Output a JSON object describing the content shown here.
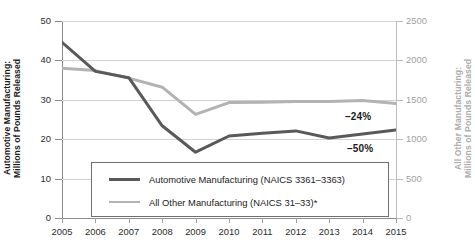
{
  "chart_data": {
    "type": "line",
    "title": "",
    "xlabel": "",
    "categories": [
      "2005",
      "2006",
      "2007",
      "2008",
      "2009",
      "2010",
      "2011",
      "2012",
      "2013",
      "2014",
      "2015"
    ],
    "x": [
      2005,
      2006,
      2007,
      2008,
      2009,
      2010,
      2011,
      2012,
      2013,
      2014,
      2015
    ],
    "grid": true,
    "legend_position": "inside-bottom-center",
    "axes": {
      "left": {
        "label_line1": "Automotive Manufacturing:",
        "label_line2": "Millions of Pounds Released",
        "ticks": [
          0,
          10,
          20,
          30,
          40,
          50
        ],
        "tick_labels": [
          "0",
          "10",
          "20",
          "30",
          "40",
          "50"
        ],
        "ylim": [
          0,
          50
        ],
        "color": "#1b1b1b"
      },
      "right": {
        "label_line1": "All Other Manufacturing:",
        "label_line2": "Millions of Pounds Released",
        "ticks": [
          0,
          500,
          1000,
          1500,
          2000,
          2500
        ],
        "tick_labels": [
          "0",
          "500",
          "1000",
          "1500",
          "2000",
          "2500"
        ],
        "ylim": [
          0,
          2500
        ],
        "color": "#adadad"
      }
    },
    "series": [
      {
        "name": "Automotive Manufacturing (NAICS 3361–3363)",
        "axis": "left",
        "color": "#595959",
        "width": 3,
        "values": [
          44.6,
          37.2,
          35.6,
          23.4,
          16.7,
          20.8,
          21.5,
          22.1,
          20.3,
          21.3,
          22.3
        ]
      },
      {
        "name": "All Other Manufacturing (NAICS 31–33)*",
        "axis": "right",
        "color": "#b3b3b3",
        "width": 3,
        "values": [
          1900,
          1870,
          1775,
          1660,
          1315,
          1465,
          1470,
          1478,
          1480,
          1490,
          1452
        ]
      }
    ],
    "annotations": [
      {
        "text": "–24%",
        "series": "All Other Manufacturing",
        "x": 2015
      },
      {
        "text": "–50%",
        "series": "Automotive Manufacturing",
        "x": 2015
      }
    ],
    "legend": [
      {
        "label": "Automotive Manufacturing (NAICS 3361–3363)",
        "color": "#595959"
      },
      {
        "label": "All Other Manufacturing (NAICS 31–33)*",
        "color": "#b3b3b3"
      }
    ]
  }
}
